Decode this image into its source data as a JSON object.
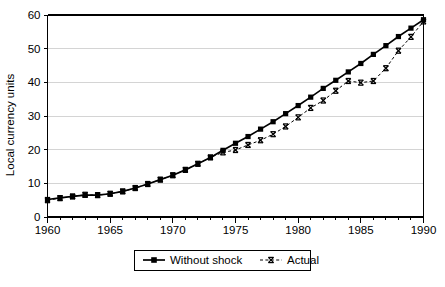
{
  "chart_data": {
    "type": "line",
    "title": "",
    "subtitle": "",
    "xlabel": "",
    "ylabel": "Local currency units",
    "xlim": [
      1960,
      1990
    ],
    "ylim": [
      0,
      60
    ],
    "ytick_values": [
      0,
      10,
      20,
      30,
      40,
      50,
      60
    ],
    "ytick_labels": [
      "0",
      "10",
      "20",
      "30",
      "40",
      "50",
      "60"
    ],
    "xtick_values": [
      1960,
      1965,
      1970,
      1975,
      1980,
      1985,
      1990
    ],
    "xtick_labels": [
      "1960",
      "1965",
      "1970",
      "1975",
      "1980",
      "1985",
      "1990"
    ],
    "x_minor_tick_interval": 1,
    "grid": "horizontal",
    "grid_color": "#c9c9c9",
    "legend_position": "bottom-center",
    "x": [
      1960,
      1961,
      1962,
      1963,
      1964,
      1965,
      1966,
      1967,
      1968,
      1969,
      1970,
      1971,
      1972,
      1973,
      1974,
      1975,
      1976,
      1977,
      1978,
      1979,
      1980,
      1981,
      1982,
      1983,
      1984,
      1985,
      1986,
      1987,
      1988,
      1989,
      1990
    ],
    "series": [
      {
        "name": "Without shock",
        "marker": "square",
        "line_style": "solid",
        "color": "#000000",
        "values": [
          5.2,
          5.7,
          6.1,
          6.5,
          6.5,
          6.9,
          7.6,
          8.6,
          9.8,
          11.1,
          12.4,
          14.0,
          15.8,
          17.7,
          19.8,
          21.9,
          23.9,
          26.1,
          28.3,
          30.7,
          33.1,
          35.6,
          38.2,
          40.6,
          43.1,
          45.6,
          48.3,
          50.9,
          53.6,
          56.1,
          58.6
        ]
      },
      {
        "name": "Actual",
        "marker": "x",
        "line_style": "dashed",
        "color": "#000000",
        "values": [
          5.0,
          5.6,
          6.1,
          6.6,
          6.5,
          6.9,
          7.6,
          8.6,
          9.8,
          11.1,
          12.4,
          14.0,
          15.8,
          17.7,
          19.2,
          19.9,
          21.4,
          22.8,
          24.6,
          26.9,
          29.6,
          32.4,
          34.6,
          37.5,
          40.4,
          39.9,
          40.4,
          44.2,
          49.4,
          53.5,
          58.1
        ]
      }
    ]
  },
  "legend": {
    "entries": [
      {
        "label": "Without shock"
      },
      {
        "label": "Actual"
      }
    ]
  },
  "axis": {
    "y_title": "Local currency units"
  }
}
